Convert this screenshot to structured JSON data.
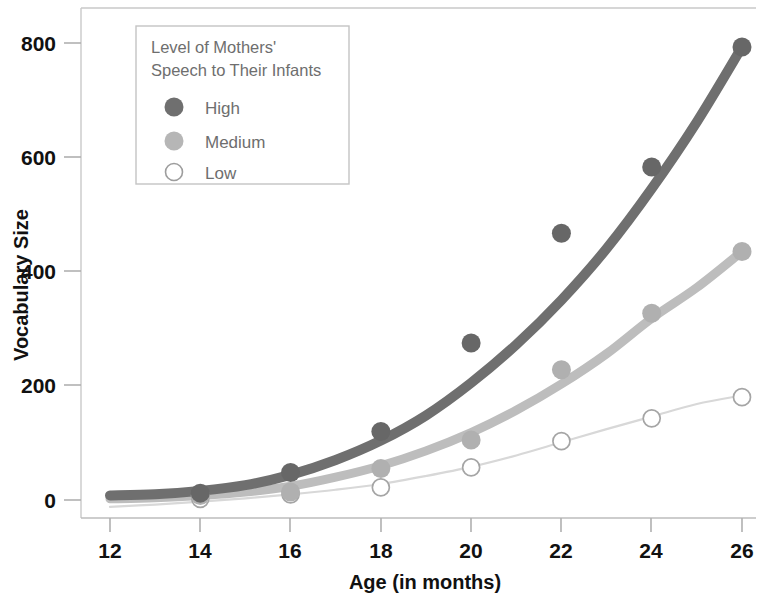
{
  "chart_data": {
    "type": "scatter",
    "title": "",
    "xlabel": "Age (in months)",
    "ylabel": "Vocabulary Size",
    "xlim": [
      11,
      26.8
    ],
    "ylim": [
      -40,
      860
    ],
    "xticks": [
      12,
      14,
      16,
      18,
      20,
      22,
      24,
      26
    ],
    "yticks": [
      0,
      200,
      400,
      600,
      800
    ],
    "grid": false,
    "legend_position": "top-left-inside",
    "legend_title": "Level of Mothers' Speech to Their Infants",
    "x": [
      14,
      16,
      18,
      20,
      22,
      24,
      26
    ],
    "series": [
      {
        "name": "High",
        "marker": "filled-circle",
        "color": "#6b6b6b",
        "values": [
          12,
          48,
          120,
          275,
          467,
          583,
          793
        ],
        "fit_curve": [
          [
            12,
            8
          ],
          [
            13,
            10
          ],
          [
            14,
            16
          ],
          [
            15,
            26
          ],
          [
            16,
            44
          ],
          [
            17,
            70
          ],
          [
            18,
            104
          ],
          [
            19,
            148
          ],
          [
            20,
            205
          ],
          [
            21,
            272
          ],
          [
            22,
            350
          ],
          [
            23,
            440
          ],
          [
            24,
            545
          ],
          [
            25,
            662
          ],
          [
            26,
            793
          ]
        ]
      },
      {
        "name": "Medium",
        "marker": "filled-circle-light",
        "color": "#b4b4b4",
        "values": [
          8,
          14,
          55,
          105,
          228,
          327,
          435
        ],
        "fit_curve": [
          [
            12,
            2
          ],
          [
            13,
            4
          ],
          [
            14,
            8
          ],
          [
            15,
            14
          ],
          [
            16,
            24
          ],
          [
            17,
            40
          ],
          [
            18,
            60
          ],
          [
            19,
            86
          ],
          [
            20,
            118
          ],
          [
            21,
            157
          ],
          [
            22,
            203
          ],
          [
            23,
            256
          ],
          [
            24,
            318
          ],
          [
            25,
            372
          ],
          [
            26,
            435
          ]
        ]
      },
      {
        "name": "Low",
        "marker": "open-circle",
        "color": "#d5d5d5",
        "values": [
          2,
          10,
          22,
          57,
          103,
          143,
          180
        ],
        "fit_curve": [
          [
            12,
            -12
          ],
          [
            13,
            -8
          ],
          [
            14,
            -3
          ],
          [
            15,
            3
          ],
          [
            16,
            10
          ],
          [
            17,
            18
          ],
          [
            18,
            28
          ],
          [
            19,
            42
          ],
          [
            20,
            58
          ],
          [
            21,
            78
          ],
          [
            22,
            101
          ],
          [
            23,
            124
          ],
          [
            24,
            146
          ],
          [
            25,
            168
          ],
          [
            26,
            183
          ]
        ]
      }
    ]
  },
  "axes": {
    "y_tick_labels": [
      "800",
      "600",
      "400",
      "200",
      "0"
    ],
    "x_tick_labels": [
      "12",
      "14",
      "16",
      "18",
      "20",
      "22",
      "24",
      "26"
    ],
    "y_axis_title": "Vocabulary Size",
    "x_axis_title": "Age (in months)"
  },
  "legend": {
    "title_line1": "Level of Mothers'",
    "title_line2": "Speech to Their Infants",
    "entries": [
      {
        "label": "High",
        "marker": "filled-circle-dark",
        "color": "#6b6b6b"
      },
      {
        "label": "Medium",
        "marker": "filled-circle-gray",
        "color": "#b0b0b0"
      },
      {
        "label": "Low",
        "marker": "open-circle",
        "color": "#ffffff"
      }
    ]
  },
  "colors": {
    "high": "#6b6b6b",
    "medium": "#b4b4b4",
    "low": "#d5d5d5",
    "axis": "#b9b9b9",
    "text": "#111111",
    "legend_text": "#6e6e6e",
    "background": "#ffffff"
  }
}
